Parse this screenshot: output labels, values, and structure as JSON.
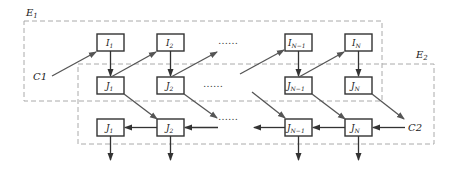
{
  "diagram": {
    "regions": [
      {
        "id": "E1",
        "label": "E",
        "sub": "1"
      },
      {
        "id": "E2",
        "label": "E",
        "sub": "2"
      }
    ],
    "top_row": [
      {
        "main": "I",
        "sub": "1"
      },
      {
        "main": "I",
        "sub": "2"
      },
      {
        "main": "I",
        "sub": "N−1"
      },
      {
        "main": "I",
        "sub": "N"
      }
    ],
    "middle_row": [
      {
        "main": "J",
        "sub": "1"
      },
      {
        "main": "J",
        "sub": "2"
      },
      {
        "main": "J",
        "sub": "N−1"
      },
      {
        "main": "J",
        "sub": "N"
      }
    ],
    "bottom_row": [
      {
        "main": "J",
        "sub": "1"
      },
      {
        "main": "J",
        "sub": "2"
      },
      {
        "main": "J",
        "sub": "N−1"
      },
      {
        "main": "J",
        "sub": "N"
      }
    ],
    "inputs": {
      "c1": "C1",
      "c2": "C2"
    },
    "ellipsis": "……",
    "colors": {
      "box_stroke": "#333333",
      "arrow": "#555555",
      "dashed": "#aaaaaa"
    }
  }
}
